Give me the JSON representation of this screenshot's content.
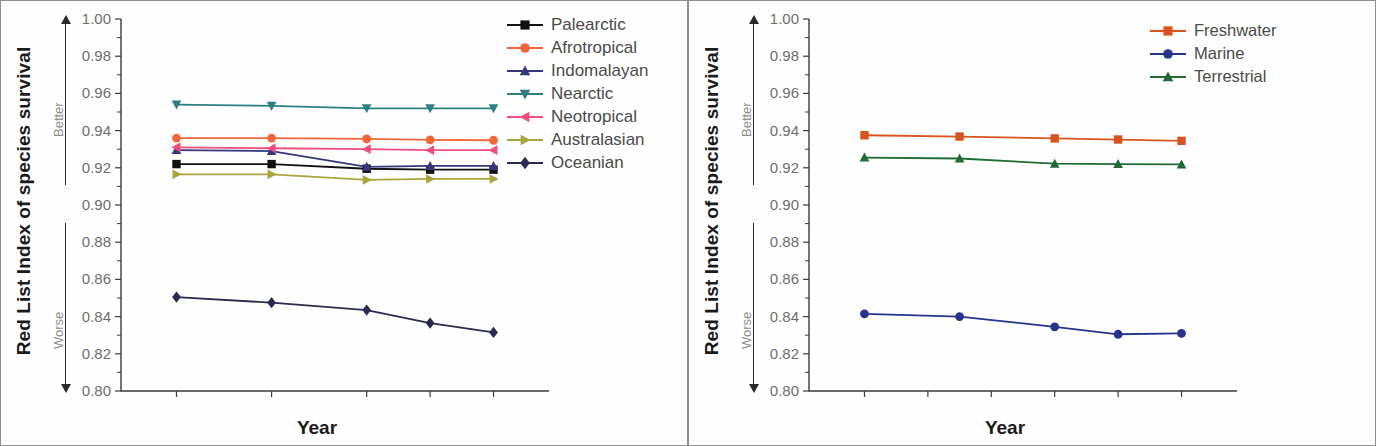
{
  "figure": {
    "panels": [
      {
        "id": "left",
        "axis": {
          "ylabel": "Red List Index of species survival",
          "xlabel": "Year",
          "direction_up": "Better",
          "direction_down": "Worse",
          "yticks": [
            "1.00",
            "0.98",
            "0.96",
            "0.94",
            "0.92",
            "0.90",
            "0.88",
            "0.86",
            "0.84",
            "0.82",
            "0.80"
          ],
          "xticks": [
            "1988",
            "1994",
            "2000",
            "2004",
            "2008"
          ]
        }
      },
      {
        "id": "right",
        "axis": {
          "ylabel": "Red List Index of species survival",
          "xlabel": "Year",
          "direction_up": "Better",
          "direction_down": "Worse",
          "yticks": [
            "1.00",
            "0.98",
            "0.96",
            "0.94",
            "0.92",
            "0.90",
            "0.88",
            "0.86",
            "0.84",
            "0.82",
            "0.80"
          ],
          "xticks": [
            "1988",
            "1992",
            "1996",
            "2000",
            "2004",
            "2008"
          ]
        }
      }
    ]
  },
  "chart_data": [
    {
      "type": "line",
      "title": "",
      "xlabel": "Year",
      "ylabel": "Red List Index of species survival",
      "x": [
        1988,
        1994,
        2000,
        2004,
        2008
      ],
      "categories": [
        "1988",
        "1994",
        "2000",
        "2004",
        "2008"
      ],
      "xtick_labels": [
        "1988",
        "1994",
        "2000",
        "2004",
        "2008"
      ],
      "xtick_values": [
        1988,
        1994,
        2000,
        2004,
        2008
      ],
      "xlim": [
        1984.5,
        2011.5
      ],
      "ylim": [
        0.8,
        1.0
      ],
      "ytick_values": [
        1.0,
        0.98,
        0.96,
        0.94,
        0.92,
        0.9,
        0.88,
        0.86,
        0.84,
        0.82,
        0.8
      ],
      "ytick_labels": [
        "1.00",
        "0.98",
        "0.96",
        "0.94",
        "0.92",
        "0.90",
        "0.88",
        "0.86",
        "0.84",
        "0.82",
        "0.80"
      ],
      "grid": false,
      "legend_position": "top-right",
      "annotations": [
        "Better",
        "Worse"
      ],
      "series": [
        {
          "name": "Palearctic",
          "marker": "square",
          "color": "#111111",
          "values": [
            0.922,
            0.922,
            0.9195,
            0.919,
            0.919
          ]
        },
        {
          "name": "Afrotropical",
          "marker": "circle",
          "color": "#F2673A",
          "values": [
            0.936,
            0.936,
            0.9355,
            0.935,
            0.9348
          ]
        },
        {
          "name": "Indomalayan",
          "marker": "triangle-up",
          "color": "#36367E",
          "values": [
            0.9295,
            0.929,
            0.9205,
            0.921,
            0.921
          ]
        },
        {
          "name": "Nearctic",
          "marker": "triangle-down",
          "color": "#2E7F84",
          "values": [
            0.954,
            0.9533,
            0.952,
            0.952,
            0.952
          ]
        },
        {
          "name": "Neotropical",
          "marker": "triangle-left",
          "color": "#F04E7C",
          "values": [
            0.931,
            0.9305,
            0.93,
            0.9295,
            0.9295
          ]
        },
        {
          "name": "Australasian",
          "marker": "triangle-right",
          "color": "#A9A53C",
          "values": [
            0.9165,
            0.9165,
            0.9135,
            0.914,
            0.914
          ]
        },
        {
          "name": "Oceanian",
          "marker": "diamond",
          "color": "#2B2B52",
          "values": [
            0.8505,
            0.8475,
            0.8435,
            0.8365,
            0.8315
          ]
        }
      ]
    },
    {
      "type": "line",
      "title": "",
      "xlabel": "Year",
      "ylabel": "Red List Index of species survival",
      "x": [
        1988,
        1994,
        2000,
        2004,
        2008
      ],
      "categories": [
        "1988",
        "1994",
        "2000",
        "2004",
        "2008"
      ],
      "xtick_labels": [
        "1988",
        "1992",
        "1996",
        "2000",
        "2004",
        "2008"
      ],
      "xtick_values": [
        1988,
        1992,
        1996,
        2000,
        2004,
        2008
      ],
      "xlim": [
        1984.5,
        2011.5
      ],
      "ylim": [
        0.8,
        1.0
      ],
      "ytick_values": [
        1.0,
        0.98,
        0.96,
        0.94,
        0.92,
        0.9,
        0.88,
        0.86,
        0.84,
        0.82,
        0.8
      ],
      "ytick_labels": [
        "1.00",
        "0.98",
        "0.96",
        "0.94",
        "0.92",
        "0.90",
        "0.88",
        "0.86",
        "0.84",
        "0.82",
        "0.80"
      ],
      "grid": false,
      "legend_position": "top-right",
      "annotations": [
        "Better",
        "Worse"
      ],
      "series": [
        {
          "name": "Freshwater",
          "marker": "square",
          "color": "#D9531E",
          "values": [
            0.9375,
            0.9368,
            0.9358,
            0.9352,
            0.9345
          ]
        },
        {
          "name": "Marine",
          "marker": "circle",
          "color": "#27348B",
          "values": [
            0.8415,
            0.84,
            0.8345,
            0.8305,
            0.831
          ]
        },
        {
          "name": "Terrestrial",
          "marker": "triangle-up",
          "color": "#1F6B33",
          "values": [
            0.9255,
            0.925,
            0.9222,
            0.922,
            0.9218
          ]
        }
      ]
    }
  ],
  "legends": {
    "left": [
      {
        "label": "Palearctic",
        "color": "#111111",
        "marker": "square"
      },
      {
        "label": "Afrotropical",
        "color": "#F2673A",
        "marker": "circle"
      },
      {
        "label": "Indomalayan",
        "color": "#36367E",
        "marker": "triangle-up"
      },
      {
        "label": "Nearctic",
        "color": "#2E7F84",
        "marker": "triangle-down"
      },
      {
        "label": "Neotropical",
        "color": "#F04E7C",
        "marker": "triangle-left"
      },
      {
        "label": "Australasian",
        "color": "#A9A53C",
        "marker": "triangle-right"
      },
      {
        "label": "Oceanian",
        "color": "#2B2B52",
        "marker": "diamond"
      }
    ],
    "right": [
      {
        "label": "Freshwater",
        "color": "#D9531E",
        "marker": "square"
      },
      {
        "label": "Marine",
        "color": "#27348B",
        "marker": "circle"
      },
      {
        "label": "Terrestrial",
        "color": "#1F6B33",
        "marker": "triangle-up"
      }
    ]
  }
}
